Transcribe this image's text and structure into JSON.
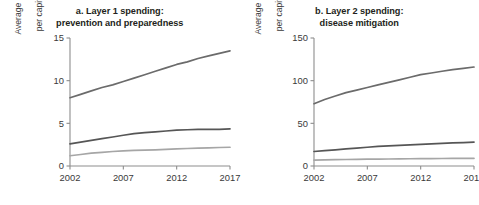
{
  "figure": {
    "background_color": "#ffffff",
    "text_color": "#231f20"
  },
  "panels": [
    {
      "title_line1": "a. Layer 1 spending:",
      "title_line2": "prevention and preparedness",
      "ylabel_line1": "Average spending",
      "ylabel_line2": "per capita (US$)",
      "yticks": [
        "0",
        "5",
        "10",
        "15"
      ],
      "xticks": [
        "2002",
        "2007",
        "2012",
        "2017"
      ]
    },
    {
      "title_line1": "b. Layer 2 spending:",
      "title_line2": "disease mitigation",
      "ylabel_line1": "Average spending",
      "ylabel_line2": "per capita (US$)",
      "yticks": [
        "0",
        "50",
        "100",
        "150"
      ],
      "xticks": [
        "2002",
        "2007",
        "2012",
        "2017"
      ]
    }
  ],
  "chart_data": [
    {
      "type": "line",
      "title": "a. Layer 1 spending: prevention and preparedness",
      "xlabel": "",
      "ylabel": "Average spending per capita (US$)",
      "x": [
        2002,
        2003,
        2004,
        2005,
        2006,
        2007,
        2008,
        2009,
        2010,
        2011,
        2012,
        2013,
        2014,
        2015,
        2016,
        2017
      ],
      "xlim": [
        2002,
        2017
      ],
      "ylim": [
        0,
        15
      ],
      "yticks": [
        0,
        5,
        10,
        15
      ],
      "xticks": [
        2002,
        2007,
        2012,
        2017
      ],
      "grid": false,
      "legend": "none",
      "series": [
        {
          "name": "high-income",
          "color": "#6b6b6b",
          "values": [
            8.0,
            8.4,
            8.8,
            9.2,
            9.5,
            9.9,
            10.3,
            10.7,
            11.1,
            11.5,
            11.9,
            12.2,
            12.6,
            12.9,
            13.2,
            13.5
          ]
        },
        {
          "name": "upper-middle-income",
          "color": "#565656",
          "values": [
            2.6,
            2.8,
            3.0,
            3.2,
            3.4,
            3.6,
            3.8,
            3.9,
            4.0,
            4.1,
            4.2,
            4.25,
            4.3,
            4.3,
            4.3,
            4.35
          ]
        },
        {
          "name": "lower-income",
          "color": "#a6a6a6",
          "values": [
            1.2,
            1.35,
            1.5,
            1.6,
            1.7,
            1.78,
            1.82,
            1.86,
            1.9,
            1.95,
            2.0,
            2.05,
            2.1,
            2.13,
            2.17,
            2.2
          ]
        }
      ]
    },
    {
      "type": "line",
      "title": "b. Layer 2 spending: disease mitigation",
      "xlabel": "",
      "ylabel": "Average spending per capita (US$)",
      "x": [
        2002,
        2003,
        2004,
        2005,
        2006,
        2007,
        2008,
        2009,
        2010,
        2011,
        2012,
        2013,
        2014,
        2015,
        2016,
        2017
      ],
      "xlim": [
        2002,
        2017
      ],
      "ylim": [
        0,
        150
      ],
      "yticks": [
        0,
        50,
        100,
        150
      ],
      "xticks": [
        2002,
        2007,
        2012,
        2017
      ],
      "grid": false,
      "legend": "none",
      "series": [
        {
          "name": "high-income",
          "color": "#6b6b6b",
          "values": [
            73,
            78,
            82,
            86,
            89,
            92,
            95,
            98,
            101,
            104,
            107,
            109,
            111,
            113,
            114.5,
            116
          ]
        },
        {
          "name": "upper-middle-income",
          "color": "#565656",
          "values": [
            17,
            18,
            19,
            20,
            21,
            22,
            23,
            23.6,
            24.2,
            24.8,
            25.4,
            26,
            26.5,
            27,
            27.5,
            28
          ]
        },
        {
          "name": "lower-income",
          "color": "#a6a6a6",
          "values": [
            7.0,
            7.2,
            7.4,
            7.6,
            7.8,
            8.0,
            8.1,
            8.2,
            8.35,
            8.5,
            8.6,
            8.7,
            8.8,
            8.85,
            8.9,
            9.0
          ]
        }
      ]
    }
  ]
}
